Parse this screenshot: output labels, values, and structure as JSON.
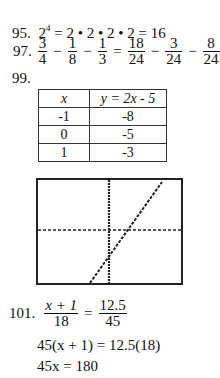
{
  "problems": {
    "p95": {
      "number": "95.",
      "base": "2",
      "exponent": "4",
      "rest": " = 2 • 2 • 2 • 2 = 16"
    },
    "p97": {
      "number": "97.",
      "fractions": [
        {
          "num": "3",
          "den": "4"
        },
        {
          "num": "1",
          "den": "8"
        },
        {
          "num": "1",
          "den": "3"
        },
        {
          "num": "18",
          "den": "24"
        },
        {
          "num": "3",
          "den": "24"
        },
        {
          "num": "8",
          "den": "24"
        },
        {
          "num": "7",
          "den": "24"
        }
      ],
      "ops": [
        "−",
        "−",
        "=",
        "−",
        "−",
        "="
      ]
    },
    "p99": {
      "number": "99.",
      "table": {
        "headers": [
          "x",
          "y = 2x - 5"
        ],
        "rows": [
          [
            "-1",
            "-8"
          ],
          [
            "0",
            "-5"
          ],
          [
            "1",
            "-3"
          ]
        ]
      },
      "graph": {
        "description": "calculator graph of line y = 2x - 5 with dotted axes"
      }
    },
    "p101": {
      "number": "101.",
      "lhs_num": "x + 1",
      "lhs_den": "18",
      "eq": "=",
      "rhs_num": "12.5",
      "rhs_den": "45",
      "step1": "45(x + 1) = 12.5(18)",
      "step2": "45x = 180"
    }
  }
}
